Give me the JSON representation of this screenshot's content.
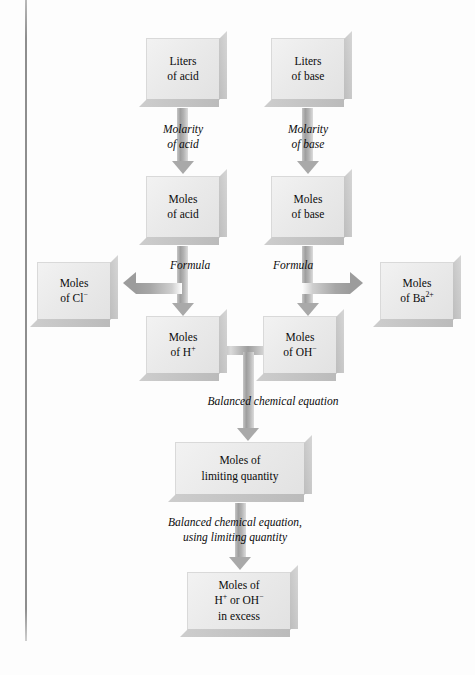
{
  "diagram": {
    "boxes": {
      "liters_acid": "Liters\nof acid",
      "liters_acid_l1": "Liters",
      "liters_acid_l2": "of acid",
      "liters_base_l1": "Liters",
      "liters_base_l2": "of base",
      "moles_acid_l1": "Moles",
      "moles_acid_l2": "of acid",
      "moles_base_l1": "Moles",
      "moles_base_l2": "of base",
      "moles_cl_l1": "Moles",
      "moles_cl_l2": "of Cl",
      "moles_cl_sup": "−",
      "moles_ba_l1": "Moles",
      "moles_ba_l2": "of Ba",
      "moles_ba_sup": "2+",
      "moles_h_l1": "Moles",
      "moles_h_l2": "of H",
      "moles_h_sup": "+",
      "moles_oh_l1": "Moles",
      "moles_oh_l2": "of OH",
      "moles_oh_sup": "−",
      "limiting_l1": "Moles of",
      "limiting_l2": "limiting quantity",
      "excess_l1": "Moles of",
      "excess_l2_a": "H",
      "excess_l2_sup_a": "+",
      "excess_l2_mid": " or OH",
      "excess_l2_sup_b": "−",
      "excess_l3": "in excess"
    },
    "captions": {
      "molarity_acid_l1": "Molarity",
      "molarity_acid_l2": "of acid",
      "molarity_base_l1": "Molarity",
      "molarity_base_l2": "of base",
      "formula_left": "Formula",
      "formula_right": "Formula",
      "balanced_eq": "Balanced chemical equation",
      "balanced_eq_limiting_l1": "Balanced chemical equation,",
      "balanced_eq_limiting_l2": "using limiting quantity"
    },
    "colors": {
      "box_face": "#eaeaea",
      "box_bevel": "#c4c4c4",
      "arrow": "#a6a6a6",
      "text": "#0b0b0b",
      "page_rule": "#8e8e8e"
    }
  }
}
